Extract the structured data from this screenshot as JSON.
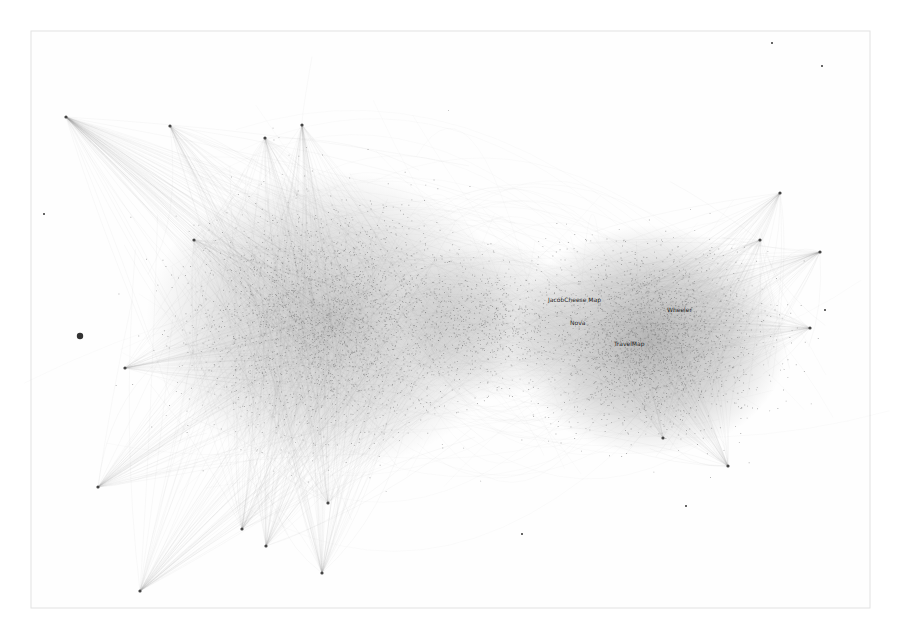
{
  "graph": {
    "type": "force-directed network",
    "frame": {
      "x": 31,
      "y": 31,
      "width": 839,
      "height": 577,
      "stroke": "#e2e2e2"
    },
    "colors": {
      "edge": "#9a9a9a",
      "node": "#6a6a6a",
      "background": "#ffffff",
      "label": "#1e1e1e"
    },
    "clusters": [
      {
        "name": "left-cluster",
        "cx": 330,
        "cy": 320,
        "rx": 160,
        "ry": 130,
        "density": 2600,
        "darkness": 0.55
      },
      {
        "name": "right-cluster",
        "cx": 650,
        "cy": 340,
        "rx": 120,
        "ry": 100,
        "density": 2200,
        "darkness": 0.75
      },
      {
        "name": "bridge",
        "cx": 490,
        "cy": 320,
        "rx": 80,
        "ry": 70,
        "density": 500,
        "darkness": 0.35
      }
    ],
    "hubs": [
      {
        "x": 66,
        "y": 117,
        "target": "left-cluster",
        "fan": 90
      },
      {
        "x": 170,
        "y": 126,
        "target": "left-cluster",
        "fan": 40
      },
      {
        "x": 265,
        "y": 138,
        "target": "left-cluster",
        "fan": 40
      },
      {
        "x": 302,
        "y": 125,
        "target": "left-cluster",
        "fan": 40
      },
      {
        "x": 194,
        "y": 240,
        "target": "left-cluster",
        "fan": 30
      },
      {
        "x": 125,
        "y": 368,
        "target": "left-cluster",
        "fan": 40
      },
      {
        "x": 98,
        "y": 487,
        "target": "left-cluster",
        "fan": 50
      },
      {
        "x": 140,
        "y": 591,
        "target": "left-cluster",
        "fan": 55
      },
      {
        "x": 242,
        "y": 529,
        "target": "left-cluster",
        "fan": 40
      },
      {
        "x": 266,
        "y": 546,
        "target": "left-cluster",
        "fan": 40
      },
      {
        "x": 322,
        "y": 573,
        "target": "left-cluster",
        "fan": 45
      },
      {
        "x": 328,
        "y": 503,
        "target": "left-cluster",
        "fan": 35
      },
      {
        "x": 780,
        "y": 193,
        "target": "right-cluster",
        "fan": 40
      },
      {
        "x": 760,
        "y": 240,
        "target": "right-cluster",
        "fan": 30
      },
      {
        "x": 820,
        "y": 252,
        "target": "right-cluster",
        "fan": 45
      },
      {
        "x": 810,
        "y": 328,
        "target": "right-cluster",
        "fan": 40
      },
      {
        "x": 728,
        "y": 466,
        "target": "right-cluster",
        "fan": 45
      },
      {
        "x": 663,
        "y": 438,
        "target": "right-cluster",
        "fan": 20
      }
    ],
    "isolated_nodes": [
      {
        "x": 80,
        "y": 336,
        "r": 3.2
      },
      {
        "x": 44,
        "y": 214,
        "r": 1
      },
      {
        "x": 772,
        "y": 43,
        "r": 1
      },
      {
        "x": 822,
        "y": 66,
        "r": 1
      },
      {
        "x": 825,
        "y": 310,
        "r": 1
      },
      {
        "x": 522,
        "y": 534,
        "r": 1
      },
      {
        "x": 686,
        "y": 506,
        "r": 1
      }
    ],
    "labels": [
      {
        "text": "JacobCheese Map",
        "x": 548,
        "y": 302
      },
      {
        "text": "Nova",
        "x": 570,
        "y": 325
      },
      {
        "text": "Wheeler",
        "x": 667,
        "y": 312
      },
      {
        "text": "TravelMap",
        "x": 614,
        "y": 346
      }
    ]
  }
}
